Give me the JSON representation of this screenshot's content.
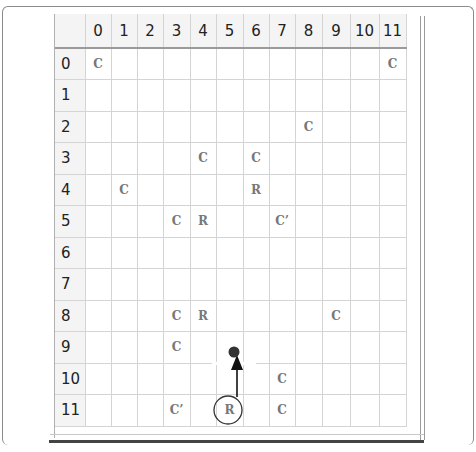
{
  "grid": {
    "columns": [
      "0",
      "1",
      "2",
      "3",
      "4",
      "5",
      "6",
      "7",
      "8",
      "9",
      "10",
      "11"
    ],
    "rows": [
      "0",
      "1",
      "2",
      "3",
      "4",
      "5",
      "6",
      "7",
      "8",
      "9",
      "10",
      "11"
    ],
    "column_widths": [
      26,
      26,
      26,
      27,
      26,
      27,
      26,
      26,
      27,
      28,
      29,
      27
    ],
    "cells": [
      [
        "C",
        "",
        "",
        "",
        "",
        "",
        "",
        "",
        "",
        "",
        "",
        "C"
      ],
      [
        "",
        "",
        "",
        "",
        "",
        "",
        "",
        "",
        "",
        "",
        "",
        ""
      ],
      [
        "",
        "",
        "",
        "",
        "",
        "",
        "",
        "",
        "C",
        "",
        "",
        ""
      ],
      [
        "",
        "",
        "",
        "",
        "C",
        "",
        "C",
        "",
        "",
        "",
        "",
        ""
      ],
      [
        "",
        "C",
        "",
        "",
        "",
        "",
        "R",
        "",
        "",
        "",
        "",
        ""
      ],
      [
        "",
        "",
        "",
        "C",
        "R",
        "",
        "",
        "C’",
        "",
        "",
        "",
        ""
      ],
      [
        "",
        "",
        "",
        "",
        "",
        "",
        "",
        "",
        "",
        "",
        "",
        ""
      ],
      [
        "",
        "",
        "",
        "",
        "",
        "",
        "",
        "",
        "",
        "",
        "",
        ""
      ],
      [
        "",
        "",
        "",
        "C",
        "R",
        "",
        "",
        "",
        "",
        "C",
        "",
        ""
      ],
      [
        "",
        "",
        "",
        "C",
        "",
        "",
        "",
        "",
        "",
        "",
        "",
        ""
      ],
      [
        "",
        "",
        "",
        "",
        "",
        "",
        "",
        "C",
        "",
        "",
        "",
        ""
      ],
      [
        "",
        "",
        "",
        "C’",
        "",
        "",
        "",
        "C",
        "",
        "",
        "",
        ""
      ]
    ]
  },
  "annotations": {
    "circled_cell": {
      "row": 11,
      "col": 5,
      "label": "R"
    },
    "arrow": {
      "from": "circled R at row 11, col 5",
      "to": "dot at row 9, between col 5 and 6",
      "direction": "up"
    },
    "dot": {
      "row": 9,
      "col_between": [
        5,
        6
      ]
    }
  },
  "colors": {
    "marker_text": "#777777",
    "grid_line": "#d4d4d4",
    "arrow": "#111111",
    "dot": "#333333"
  }
}
